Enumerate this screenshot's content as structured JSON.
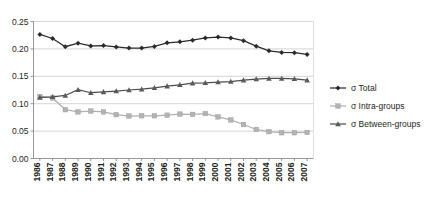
{
  "chart_data": {
    "type": "line",
    "title": "",
    "subtitle": "",
    "xlabel": "",
    "ylabel": "",
    "categories": [
      "1986",
      "1987",
      "1988",
      "1989",
      "1990",
      "1991",
      "1992",
      "1993",
      "1994",
      "1995",
      "1996",
      "1997",
      "1998",
      "1999",
      "2000",
      "2001",
      "2002",
      "2003",
      "2004",
      "2005",
      "2006",
      "2007"
    ],
    "ylim": [
      0.0,
      0.25
    ],
    "yticks": [
      "0.00",
      "0.05",
      "0.10",
      "0.15",
      "0.20",
      "0.25"
    ],
    "ytick_values": [
      0.0,
      0.05,
      0.1,
      0.15,
      0.2,
      0.25
    ],
    "grid": true,
    "legend_position": "right",
    "series": [
      {
        "name": "σ Total",
        "marker": "diamond",
        "color": "#2b2b2b",
        "values": [
          0.2265,
          0.219,
          0.204,
          0.2105,
          0.2055,
          0.206,
          0.2035,
          0.2015,
          0.2015,
          0.2045,
          0.211,
          0.213,
          0.216,
          0.22,
          0.2215,
          0.22,
          0.215,
          0.205,
          0.1965,
          0.1935,
          0.193,
          0.19
        ]
      },
      {
        "name": "σ Intra-groups",
        "marker": "square",
        "color": "#b3b3b3",
        "values": [
          0.113,
          0.1105,
          0.089,
          0.085,
          0.0865,
          0.085,
          0.08,
          0.0775,
          0.078,
          0.078,
          0.079,
          0.081,
          0.0805,
          0.082,
          0.076,
          0.0705,
          0.062,
          0.053,
          0.049,
          0.047,
          0.047,
          0.0475
        ]
      },
      {
        "name": "σ Between-groups",
        "marker": "triangle",
        "color": "#5a5a5a",
        "values": [
          0.1115,
          0.1125,
          0.115,
          0.1255,
          0.12,
          0.1215,
          0.123,
          0.125,
          0.1265,
          0.129,
          0.132,
          0.1345,
          0.1375,
          0.138,
          0.1395,
          0.1405,
          0.143,
          0.145,
          0.146,
          0.146,
          0.1455,
          0.143
        ]
      }
    ]
  },
  "legend": {
    "items": [
      {
        "label": "σ Total"
      },
      {
        "label": "σ Intra-groups"
      },
      {
        "label": "σ Between-groups"
      }
    ]
  }
}
